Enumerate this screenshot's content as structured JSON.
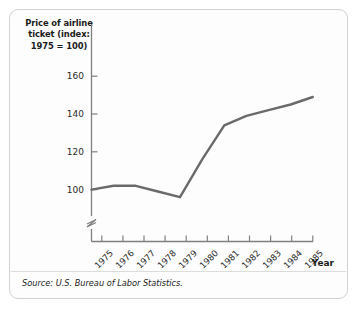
{
  "figure": {
    "background_color": "#fdfdfd",
    "border_color": "#d2d2d0"
  },
  "axis_title": {
    "line1": "Price of airline",
    "line2": "ticket (index:",
    "line3": "1975 = 100)"
  },
  "xlabel_text": "Year",
  "source_note": "Source: U.S. Bureau of Labor Statistics.",
  "chart_data": {
    "type": "line",
    "title": "",
    "subtitle": "",
    "xlabel": "Year",
    "ylabel": "Price of airline ticket (index: 1975 = 100)",
    "x": [
      1975,
      1976,
      1977,
      1978,
      1979,
      1980,
      1981,
      1982,
      1983,
      1984,
      1985
    ],
    "categories": [
      "1975",
      "1976",
      "1977",
      "1978",
      "1979",
      "1980",
      "1981",
      "1982",
      "1983",
      "1984",
      "1985"
    ],
    "values": [
      100,
      102,
      102,
      99,
      96,
      116,
      134,
      139,
      142,
      145,
      149
    ],
    "series": [
      {
        "name": "Price of airline ticket",
        "color": "#6a6a6a",
        "values": [
          100,
          102,
          102,
          99,
          96,
          116,
          134,
          139,
          142,
          145,
          149
        ]
      }
    ],
    "yticks": [
      100,
      120,
      140,
      160
    ],
    "ytick_labels": [
      "100",
      "120",
      "140",
      "160"
    ],
    "ylim": [
      92,
      168
    ],
    "xlim": [
      1975,
      1985
    ],
    "grid": false,
    "legend": false,
    "axis_break": true,
    "line_color": "#6a6a6a",
    "line_width": 2.4,
    "source": "U.S. Bureau of Labor Statistics"
  }
}
